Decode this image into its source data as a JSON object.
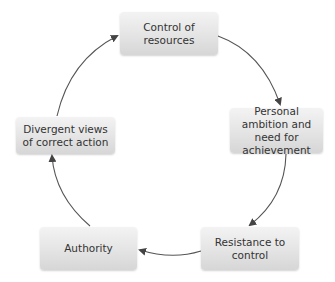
{
  "diagram": {
    "type": "cycle",
    "colors": {
      "node_fill_top": "#f3f3f3",
      "node_fill_bottom": "#d6d6d6",
      "arrow": "#444444",
      "text": "#333333"
    },
    "nodes": [
      {
        "id": "control",
        "label": "Control of resources"
      },
      {
        "id": "ambition",
        "label": "Personal ambition and need for achievement"
      },
      {
        "id": "resistance",
        "label": "Resistance to control"
      },
      {
        "id": "authority",
        "label": "Authority"
      },
      {
        "id": "divergent",
        "label": "Divergent views of correct action"
      }
    ],
    "edges": [
      {
        "from": "control",
        "to": "ambition"
      },
      {
        "from": "ambition",
        "to": "resistance"
      },
      {
        "from": "resistance",
        "to": "authority"
      },
      {
        "from": "authority",
        "to": "divergent"
      },
      {
        "from": "divergent",
        "to": "control"
      }
    ]
  }
}
